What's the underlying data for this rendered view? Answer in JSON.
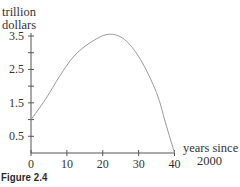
{
  "figure": {
    "caption": "Figure 2.4"
  },
  "chart_data": {
    "type": "line",
    "title": "",
    "ylabel_line1": "trillion",
    "ylabel_line2": "dollars",
    "xlabel_line1": "years since",
    "xlabel_line2": "2000",
    "xlim": [
      0,
      40
    ],
    "ylim": [
      0,
      3.5
    ],
    "x_ticks": [
      0,
      10,
      20,
      30,
      40
    ],
    "x_tick_labels": [
      "0",
      "10",
      "20",
      "30",
      "40"
    ],
    "y_ticks": [
      0.5,
      1,
      1.5,
      2,
      2.5,
      3,
      3.5
    ],
    "y_tick_labels": [
      "0.5",
      "",
      "1.5",
      "",
      "2.5",
      "",
      "3.5"
    ],
    "grid": false,
    "legend": null,
    "series": [
      {
        "name": "curve",
        "x": [
          0,
          4,
          8,
          12,
          16.5,
          21.5,
          26,
          30.5,
          35,
          37.5,
          40
        ],
        "values": [
          1.0,
          1.6,
          2.3,
          2.9,
          3.3,
          3.55,
          3.4,
          2.8,
          1.8,
          0.9,
          0.0
        ]
      }
    ]
  }
}
